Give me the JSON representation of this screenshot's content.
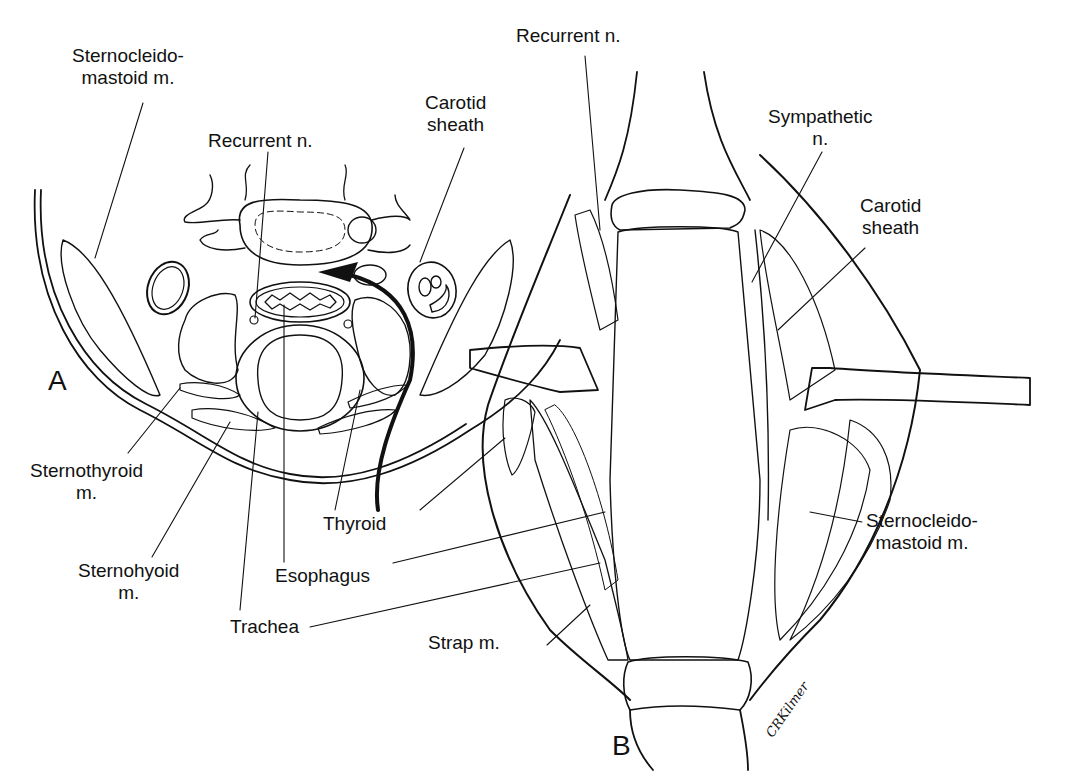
{
  "figure": {
    "panels": [
      {
        "id": "A",
        "label": "A",
        "description": "Axial cross-section of the neck",
        "callouts": [
          {
            "key": "scm",
            "lines": [
              "Sternocleido-",
              "mastoid m."
            ]
          },
          {
            "key": "recurrent",
            "lines": [
              "Recurrent n."
            ]
          },
          {
            "key": "carotid",
            "lines": [
              "Carotid",
              "sheath"
            ]
          },
          {
            "key": "sternothyroid",
            "lines": [
              "Sternothyroid",
              "m."
            ]
          },
          {
            "key": "sternohyoid",
            "lines": [
              "Sternohyoid",
              "m."
            ]
          },
          {
            "key": "trachea",
            "lines": [
              "Trachea"
            ]
          },
          {
            "key": "esophagus",
            "lines": [
              "Esophagus"
            ]
          },
          {
            "key": "thyroid",
            "lines": [
              "Thyroid"
            ]
          }
        ]
      },
      {
        "id": "B",
        "label": "B",
        "description": "Anterior operative view with retractors",
        "callouts": [
          {
            "key": "recurrent",
            "lines": [
              "Recurrent n."
            ]
          },
          {
            "key": "sympathetic",
            "lines": [
              "Sympathetic",
              "n."
            ]
          },
          {
            "key": "carotid",
            "lines": [
              "Carotid",
              "sheath"
            ]
          },
          {
            "key": "scm",
            "lines": [
              "Sternocleido-",
              "mastoid m."
            ]
          },
          {
            "key": "strap",
            "lines": [
              "Strap m."
            ]
          }
        ]
      }
    ],
    "signature": "CRKilmer",
    "colors": {
      "ink": "#111111",
      "background": "#ffffff"
    }
  }
}
